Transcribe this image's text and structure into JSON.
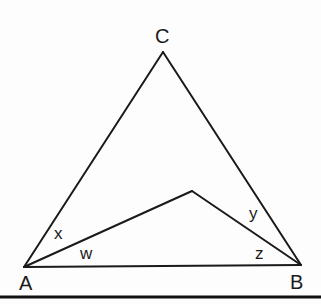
{
  "diagram": {
    "type": "geometry-triangle",
    "vertices": {
      "A": {
        "label": "A",
        "x": 24,
        "y": 267
      },
      "B": {
        "label": "B",
        "x": 301,
        "y": 265
      },
      "C": {
        "label": "C",
        "x": 163,
        "y": 52
      },
      "P": {
        "label": "",
        "x": 192,
        "y": 191
      }
    },
    "angle_labels": {
      "x": "x",
      "w": "w",
      "y": "y",
      "z": "z"
    },
    "stroke_color": "#1a1a1a",
    "background_color": "#ffffff"
  }
}
